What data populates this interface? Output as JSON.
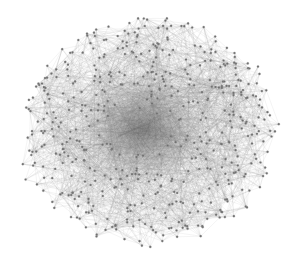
{
  "figure": {
    "type": "network-graph",
    "layout": "force-directed",
    "width": 298,
    "height": 274,
    "background": "#ffffff",
    "center": {
      "x": 148,
      "y": 132
    },
    "radius": {
      "x": 132,
      "y": 118
    },
    "dense_core": {
      "x": 143,
      "y": 130,
      "radius": 35
    },
    "node_count": 520,
    "edge_count": 2400,
    "node_radius": 1.1,
    "node_color": "#6e6e6e",
    "edge_color": "#8a8a8a",
    "edge_opacity": 0.28,
    "seed": 20240607
  }
}
